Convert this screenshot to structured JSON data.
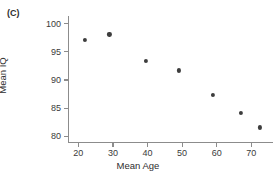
{
  "panel": {
    "label": "(C)"
  },
  "chart_data": {
    "type": "scatter",
    "title": "",
    "xlabel": "Mean Age",
    "ylabel": "Mean IQ",
    "xlim": [
      17,
      76
    ],
    "ylim": [
      79,
      101
    ],
    "xticks": [
      20,
      30,
      40,
      50,
      60,
      70
    ],
    "yticks": [
      80,
      85,
      90,
      95,
      100
    ],
    "grid": false,
    "legend": null,
    "marker": {
      "shape": "circle",
      "color": "#3d3d3d",
      "size": 4.2
    },
    "axis_color": "#8c8c8c",
    "background": "#ffffff",
    "series": [
      {
        "name": "studies",
        "points": [
          {
            "x": 22.0,
            "y": 97.1
          },
          {
            "x": 29.0,
            "y": 98.1
          },
          {
            "x": 39.5,
            "y": 93.4
          },
          {
            "x": 49.0,
            "y": 91.7
          },
          {
            "x": 59.0,
            "y": 87.4
          },
          {
            "x": 67.0,
            "y": 84.2
          },
          {
            "x": 72.5,
            "y": 81.6
          }
        ]
      }
    ]
  }
}
